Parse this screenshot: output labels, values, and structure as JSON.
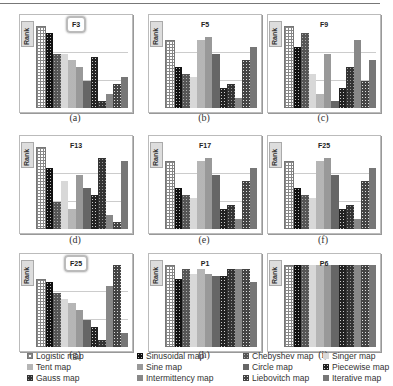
{
  "chart_data": [
    {
      "type": "bar",
      "panel": "a",
      "title": "F3",
      "ylabel": "Rank",
      "caption": "(a)",
      "categories": [
        "Logistic map",
        "Sinusoidal map",
        "Chebyshev map",
        "Singer map",
        "Tent map",
        "Sine map",
        "Circle map",
        "Piecewise map",
        "Gauss map",
        "Intermittency map",
        "Liebovitch map",
        "Iterative map"
      ],
      "values": [
        12,
        11,
        8,
        8,
        7,
        6,
        4,
        7.5,
        1,
        2,
        3.5,
        4.5
      ]
    },
    {
      "type": "bar",
      "panel": "b",
      "title": "F5",
      "ylabel": "Rank",
      "caption": "(b)",
      "categories": [
        "Logistic map",
        "Sinusoidal map",
        "Chebyshev map",
        "Singer map",
        "Tent map",
        "Sine map",
        "Circle map",
        "Piecewise map",
        "Gauss map",
        "Intermittency map",
        "Liebovitch map",
        "Iterative map"
      ],
      "values": [
        10,
        6,
        5,
        4.5,
        10,
        10.5,
        8,
        3,
        3.5,
        1.5,
        7,
        9
      ]
    },
    {
      "type": "bar",
      "panel": "c",
      "title": "F9",
      "ylabel": "Rank",
      "caption": "(c)",
      "categories": [
        "Logistic map",
        "Sinusoidal map",
        "Chebyshev map",
        "Singer map",
        "Tent map",
        "Sine map",
        "Circle map",
        "Piecewise map",
        "Gauss map",
        "Intermittency map",
        "Liebovitch map",
        "Iterative map"
      ],
      "values": [
        12,
        9,
        11,
        5,
        2,
        8,
        1,
        3,
        6,
        10,
        4,
        7
      ]
    },
    {
      "type": "bar",
      "panel": "d",
      "title": "F13",
      "ylabel": "Rank",
      "caption": "(d)",
      "categories": [
        "Logistic map",
        "Sinusoidal map",
        "Chebyshev map",
        "Singer map",
        "Tent map",
        "Sine map",
        "Circle map",
        "Piecewise map",
        "Gauss map",
        "Intermittency map",
        "Liebovitch map",
        "Iterative map"
      ],
      "values": [
        12,
        9,
        4,
        7,
        3,
        8,
        6,
        5,
        10.5,
        2,
        1,
        10
      ]
    },
    {
      "type": "bar",
      "panel": "e",
      "title": "F17",
      "ylabel": "Rank",
      "caption": "(e)",
      "categories": [
        "Logistic map",
        "Sinusoidal map",
        "Chebyshev map",
        "Singer map",
        "Tent map",
        "Sine map",
        "Circle map",
        "Piecewise map",
        "Gauss map",
        "Intermittency map",
        "Liebovitch map",
        "Iterative map"
      ],
      "values": [
        10,
        6,
        5,
        4.5,
        10,
        10.5,
        8,
        3,
        3.5,
        1.5,
        7,
        9
      ]
    },
    {
      "type": "bar",
      "panel": "f",
      "title": "F25",
      "ylabel": "Rank",
      "caption": "(f)",
      "categories": [
        "Logistic map",
        "Sinusoidal map",
        "Chebyshev map",
        "Singer map",
        "Tent map",
        "Sine map",
        "Circle map",
        "Piecewise map",
        "Gauss map",
        "Intermittency map",
        "Liebovitch map",
        "Iterative map"
      ],
      "values": [
        10,
        6,
        5,
        4.5,
        10,
        10.5,
        8,
        3,
        3.5,
        1.5,
        7,
        9
      ]
    },
    {
      "type": "bar",
      "panel": "g",
      "title": "F25",
      "ylabel": "Rank",
      "caption": "(g)",
      "categories": [
        "Logistic map",
        "Sinusoidal map",
        "Chebyshev map",
        "Singer map",
        "Tent map",
        "Sine map",
        "Circle map",
        "Piecewise map",
        "Gauss map",
        "Intermittency map",
        "Liebovitch map",
        "Iterative map"
      ],
      "values": [
        10,
        9.5,
        8,
        7,
        6.5,
        5.5,
        4,
        3,
        1,
        9,
        12,
        2
      ]
    },
    {
      "type": "bar",
      "panel": "h",
      "title": "P1",
      "ylabel": "Rank",
      "caption": "(h)",
      "categories": [
        "Logistic map",
        "Sinusoidal map",
        "Chebyshev map",
        "Singer map",
        "Tent map",
        "Sine map",
        "Circle map",
        "Piecewise map",
        "Gauss map",
        "Intermittency map",
        "Liebovitch map",
        "Iterative map"
      ],
      "values": [
        12,
        10,
        11.5,
        10.8,
        11.5,
        10.8,
        10.5,
        10.5,
        11.5,
        11.5,
        11.5,
        9.5
      ]
    },
    {
      "type": "bar",
      "panel": "i",
      "title": "P6",
      "ylabel": "Rank",
      "caption": "(i)",
      "categories": [
        "Logistic map",
        "Sinusoidal map",
        "Chebyshev map",
        "Singer map",
        "Tent map",
        "Sine map",
        "Circle map",
        "Piecewise map",
        "Gauss map",
        "Intermittency map",
        "Liebovitch map",
        "Iterative map"
      ],
      "values": [
        12,
        12,
        12,
        12,
        12,
        12,
        12,
        12,
        12,
        12,
        12,
        12
      ]
    }
  ],
  "legend": [
    {
      "label": "Logistic map",
      "pattern": "p0"
    },
    {
      "label": "Sinusoidal map",
      "pattern": "p1"
    },
    {
      "label": "Chebyshev map",
      "pattern": "p2"
    },
    {
      "label": "Singer map",
      "pattern": "p3"
    },
    {
      "label": "Tent map",
      "pattern": "p4"
    },
    {
      "label": "Sine map",
      "pattern": "p5"
    },
    {
      "label": "Circle map",
      "pattern": "p6"
    },
    {
      "label": "Piecewise map",
      "pattern": "p8"
    },
    {
      "label": "Gauss map",
      "pattern": "p7"
    },
    {
      "label": "Intermittency map",
      "pattern": "p9"
    },
    {
      "label": "Liebovitch map",
      "pattern": "p10"
    },
    {
      "label": "Iterative map",
      "pattern": "p11"
    }
  ],
  "max_rank": 12.5
}
